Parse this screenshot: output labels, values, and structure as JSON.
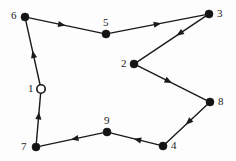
{
  "diagram": {
    "type": "directed-graph",
    "width": 236,
    "height": 161,
    "background_color": "#fdfdfd",
    "stroke_color": "#1a1a1a",
    "node_fill_solid": "#141414",
    "node_fill_hollow": "#ffffff",
    "nodes": [
      {
        "id": "1",
        "label": "1",
        "x": 41,
        "y": 89,
        "marker": "hollow-circle",
        "radius": 4.2,
        "label_x": 28,
        "label_y": 83
      },
      {
        "id": "2",
        "label": "2",
        "x": 134,
        "y": 64,
        "marker": "solid-circle",
        "radius": 4.0,
        "label_x": 121,
        "label_y": 58
      },
      {
        "id": "3",
        "label": "3",
        "x": 209,
        "y": 14,
        "marker": "solid-circle",
        "radius": 4.0,
        "label_x": 217,
        "label_y": 8
      },
      {
        "id": "4",
        "label": "4",
        "x": 163,
        "y": 146,
        "marker": "solid-circle",
        "radius": 4.0,
        "label_x": 171,
        "label_y": 140
      },
      {
        "id": "5",
        "label": "5",
        "x": 106,
        "y": 34,
        "marker": "solid-circle",
        "radius": 4.0,
        "label_x": 103,
        "label_y": 17
      },
      {
        "id": "6",
        "label": "6",
        "x": 25,
        "y": 17,
        "marker": "solid-circle",
        "radius": 4.0,
        "label_x": 11,
        "label_y": 10
      },
      {
        "id": "7",
        "label": "7",
        "x": 36,
        "y": 147,
        "marker": "solid-circle",
        "radius": 4.0,
        "label_x": 21,
        "label_y": 141
      },
      {
        "id": "8",
        "label": "8",
        "x": 210,
        "y": 102,
        "marker": "solid-circle",
        "radius": 4.0,
        "label_x": 218,
        "label_y": 96
      },
      {
        "id": "9",
        "label": "9",
        "x": 107,
        "y": 132,
        "marker": "solid-circle",
        "radius": 4.0,
        "label_x": 104,
        "label_y": 115
      }
    ],
    "edges": [
      {
        "from": "6",
        "to": "5",
        "arrow_at": 0.45,
        "direction": "right"
      },
      {
        "from": "5",
        "to": "3",
        "arrow_at": 0.5,
        "direction": "up-right"
      },
      {
        "from": "3",
        "to": "2",
        "arrow_at": 0.38,
        "direction": "down-left"
      },
      {
        "from": "2",
        "to": "8",
        "arrow_at": 0.45,
        "direction": "down-right"
      },
      {
        "from": "8",
        "to": "4",
        "arrow_at": 0.45,
        "direction": "down-left"
      },
      {
        "from": "4",
        "to": "9",
        "arrow_at": 0.45,
        "direction": "left"
      },
      {
        "from": "9",
        "to": "7",
        "arrow_at": 0.45,
        "direction": "left"
      },
      {
        "from": "7",
        "to": "1",
        "arrow_at": 0.55,
        "direction": "up"
      },
      {
        "from": "1",
        "to": "6",
        "arrow_at": 0.48,
        "direction": "up"
      }
    ]
  }
}
